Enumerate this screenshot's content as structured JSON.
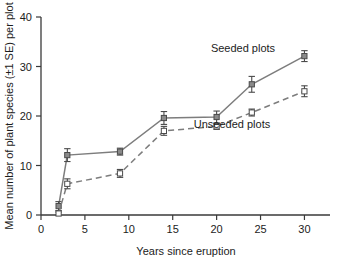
{
  "chart_data": {
    "type": "line",
    "title": "",
    "xlabel": "Years since eruption",
    "ylabel": "Mean number of plant species (±1 SE) per plot",
    "xlim": [
      0,
      32
    ],
    "ylim": [
      0,
      40
    ],
    "xticks": [
      0,
      5,
      10,
      15,
      20,
      25,
      30
    ],
    "xtick_labels": [
      "0",
      "5",
      "10",
      "15",
      "20",
      "25",
      "30"
    ],
    "yticks": [
      0,
      10,
      20,
      30,
      40
    ],
    "ytick_labels": [
      "0",
      "10",
      "20",
      "30",
      "40"
    ],
    "grid": false,
    "legend_position": "inline-annotations",
    "x": [
      2,
      3,
      9,
      14,
      20,
      24,
      30
    ],
    "series": [
      {
        "name": "Seeded plots",
        "marker": "filled-square",
        "linestyle": "solid",
        "color": "#7d7d7d",
        "values": [
          1.8,
          12.1,
          12.8,
          19.6,
          19.8,
          26.4,
          32.1
        ],
        "errors": [
          0.9,
          1.3,
          0.7,
          1.3,
          1.2,
          1.6,
          1.1
        ]
      },
      {
        "name": "Unseeded plots",
        "marker": "open-square",
        "linestyle": "dashed",
        "color": "#7d7d7d",
        "values": [
          0.3,
          6.3,
          8.4,
          17.0,
          17.9,
          20.7,
          25.0
        ],
        "errors": [
          0.3,
          1.0,
          0.8,
          0.9,
          0.6,
          0.7,
          1.1
        ]
      }
    ],
    "annotations": [
      {
        "text": "Seeded plots",
        "x_px": 243,
        "y_px": 52
      },
      {
        "text": "Unseeded plots",
        "x_px": 232,
        "y_px": 128
      }
    ]
  },
  "colors": {
    "axis": "#3a3a3a",
    "text": "#1c1c1c",
    "series_gray": "#7d7d7d",
    "background": "#ffffff"
  }
}
